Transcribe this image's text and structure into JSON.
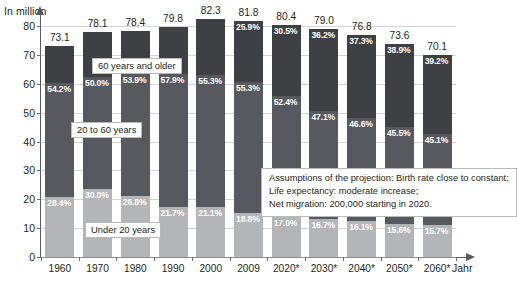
{
  "chart_data": {
    "type": "bar",
    "stacked": true,
    "title": "",
    "xlabel": "Jahr",
    "ylabel": "In million",
    "ylim": [
      0,
      80
    ],
    "yticks": [
      0,
      10,
      20,
      30,
      40,
      50,
      60,
      70,
      80
    ],
    "grid": true,
    "legend_position": "inline-callouts",
    "categories": [
      "1960",
      "1970",
      "1980",
      "1990",
      "2000",
      "2009",
      "2020*",
      "2030*",
      "2040*",
      "2050*",
      "2060*"
    ],
    "totals": [
      73.1,
      78.1,
      78.4,
      79.8,
      82.3,
      81.8,
      80.4,
      79.0,
      76.8,
      73.6,
      70.1
    ],
    "series": [
      {
        "name": "Under 20 years",
        "color": "#b4b5b7",
        "percent_labels": [
          "28.4%",
          "30.0%",
          "26.8%",
          "21.7%",
          "21.1%",
          "18.8%",
          "17.0%",
          "16.7%",
          "16.1%",
          "15.6%",
          "15.7%"
        ],
        "values": [
          20.8,
          23.4,
          21.0,
          17.3,
          17.4,
          15.4,
          13.7,
          13.2,
          12.4,
          11.5,
          11.0
        ]
      },
      {
        "name": "20 to 60 years",
        "color": "#58595e",
        "percent_labels": [
          "54.2%",
          "50.0%",
          "53.9%",
          "57.9%",
          "55.3%",
          "55.3%",
          "52.4%",
          "47.1%",
          "46.6%",
          "45.5%",
          "45.1%"
        ],
        "values": [
          39.6,
          39.1,
          42.3,
          46.2,
          45.5,
          45.2,
          42.1,
          37.2,
          35.8,
          33.5,
          31.6
        ]
      },
      {
        "name": "60 years and older",
        "color": "#3f4044",
        "percent_labels": [
          "17.4%",
          "20.0%",
          "19.3%",
          "20.4%",
          "23.6%",
          "25.9%",
          "30.5%",
          "36.2%",
          "37.3%",
          "38.9%",
          "39.2%"
        ],
        "percent_labels_shown": [
          "",
          "",
          "",
          "",
          "",
          "25.9%",
          "30.5%",
          "36.2%",
          "37.3%",
          "38.9%",
          "39.2%"
        ],
        "values": [
          12.7,
          15.6,
          15.1,
          16.3,
          19.4,
          21.2,
          24.5,
          28.6,
          28.6,
          28.6,
          27.5
        ]
      }
    ],
    "callouts": {
      "older": "60 years and older",
      "middle": "20 to 60 years",
      "young": "Under 20 years"
    },
    "annotation": {
      "line1": "Assumptions of the projection: Birth rate close to constant;",
      "line2": "Life expectancy: moderate increase;",
      "line3": "Net migration: 200,000 starting in 2020."
    }
  }
}
